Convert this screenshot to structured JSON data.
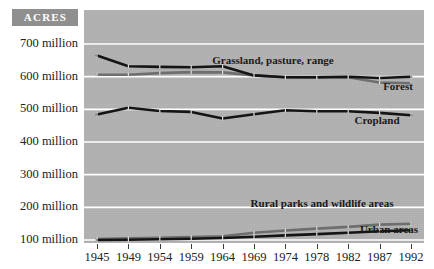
{
  "badge": {
    "label": "ACRES"
  },
  "chart_data": {
    "type": "line",
    "title": "",
    "subtitle": "",
    "xlabel": "",
    "ylabel": "ACRES",
    "grid": true,
    "legend_position": "inline-labels",
    "x": [
      1945,
      1949,
      1954,
      1959,
      1964,
      1969,
      1974,
      1978,
      1982,
      1987,
      1992
    ],
    "xtick_labels": [
      "1945",
      "1949",
      "1954",
      "1959",
      "1964",
      "1969",
      "1974",
      "1978",
      "1982",
      "1987",
      "1992"
    ],
    "ytick_labels": [
      "700 million",
      "600 million",
      "500 million",
      "400 million",
      "300 million",
      "200 million",
      "100 million"
    ],
    "ytick_values": [
      700,
      600,
      500,
      400,
      300,
      200,
      100
    ],
    "ylim": [
      40,
      740
    ],
    "yunit": "million acres",
    "series": [
      {
        "name": "Grassland, pasture, range",
        "label": "Grassland, pasture, range",
        "color": "#141414",
        "values": [
          665,
          632,
          630,
          629,
          632,
          604,
          598,
          598,
          600,
          596,
          600
        ]
      },
      {
        "name": "Forest",
        "label": "Forest",
        "color": "#6e6e6e",
        "values": [
          606,
          606,
          611,
          614,
          613,
          604,
          598,
          597,
          598,
          582,
          580
        ]
      },
      {
        "name": "Cropland",
        "label": "Cropland",
        "color": "#141414",
        "values": [
          484,
          505,
          495,
          492,
          472,
          485,
          497,
          494,
          494,
          489,
          482
        ]
      },
      {
        "name": "Rural parks and wildlife areas",
        "label": "Rural parks and wildlife areas",
        "color": "#6e6e6e",
        "values": [
          103,
          105,
          107,
          109,
          111,
          122,
          129,
          135,
          140,
          147,
          150
        ]
      },
      {
        "name": "Urban areas",
        "label": "Urban areas",
        "color": "#141414",
        "values": [
          100,
          101,
          102,
          104,
          106,
          110,
          114,
          118,
          122,
          127,
          130
        ]
      }
    ],
    "annotations": [
      {
        "text": "Grassland, pasture, range",
        "x_px": 273,
        "y_px": 64
      },
      {
        "text": "Forest",
        "x_px": 398,
        "y_px": 90
      },
      {
        "text": "Cropland",
        "x_px": 377,
        "y_px": 124
      },
      {
        "text": "Rural parks and wildlife areas",
        "x_px": 322,
        "y_px": 207
      },
      {
        "text": "Urban areas",
        "x_px": 389,
        "y_px": 233
      }
    ],
    "colors": {
      "plot_background": "#b2b2b2",
      "gridline": "#ffffff",
      "dark_series": "#141414",
      "light_series": "#6e6e6e",
      "badge_background": "#8f8f8f",
      "page_background": "#ffffff"
    }
  }
}
